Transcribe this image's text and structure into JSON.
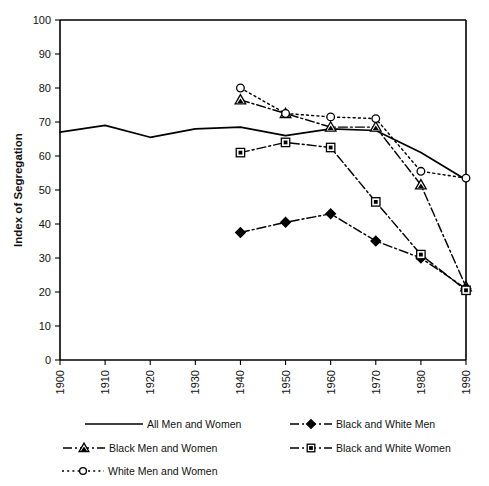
{
  "chart_data": {
    "type": "line",
    "title": "",
    "xlabel": "",
    "ylabel": "Index of Segregation",
    "categories": [
      1900,
      1910,
      1920,
      1930,
      1940,
      1950,
      1960,
      1970,
      1980,
      1990
    ],
    "x": [
      1900,
      1910,
      1920,
      1930,
      1940,
      1950,
      1960,
      1970,
      1980,
      1990
    ],
    "xlim": [
      1900,
      1990
    ],
    "ylim": [
      0,
      100
    ],
    "ytick_step": 10,
    "xtick_step": 10,
    "grid": false,
    "legend_position": "below-plot",
    "xtick_labels": [
      "1900",
      "1910",
      "1920",
      "1930",
      "1940",
      "1950",
      "1960",
      "1970",
      "1980",
      "1990"
    ],
    "ytick_labels": [
      "0",
      "10",
      "20",
      "30",
      "40",
      "50",
      "60",
      "70",
      "80",
      "90",
      "100"
    ],
    "series": [
      {
        "name": "All Men and  Women",
        "marker": "none",
        "dash": "solid",
        "x": [
          1900,
          1910,
          1920,
          1930,
          1940,
          1950,
          1960,
          1970,
          1980,
          1990
        ],
        "values": [
          67,
          69,
          65.5,
          68,
          68.5,
          66,
          68,
          67.5,
          61,
          53
        ]
      },
      {
        "name": "Black Men and Women",
        "marker": "triangle",
        "dash": "dashdot",
        "x": [
          1940,
          1950,
          1960,
          1970,
          1980,
          1990
        ],
        "values": [
          76.5,
          72.5,
          68.5,
          68.5,
          51.5,
          21.5
        ]
      },
      {
        "name": "White Men and Women",
        "marker": "circle",
        "dash": "dotted",
        "x": [
          1940,
          1950,
          1960,
          1970,
          1980,
          1990
        ],
        "values": [
          80,
          72.5,
          71.5,
          71,
          55.5,
          53.5
        ]
      },
      {
        "name": "Black and White Men",
        "marker": "diamond",
        "dash": "dashdot",
        "x": [
          1940,
          1950,
          1960,
          1970,
          1980,
          1990
        ],
        "values": [
          37.5,
          40.5,
          43,
          35,
          30,
          21
        ]
      },
      {
        "name": "Black and White Women",
        "marker": "square",
        "dash": "dashdot",
        "x": [
          1940,
          1950,
          1960,
          1970,
          1980,
          1990
        ],
        "values": [
          61,
          64,
          62.5,
          46.5,
          31,
          20.5
        ]
      }
    ]
  },
  "legend": {
    "entries": [
      {
        "label": "All Men and  Women",
        "marker": "none",
        "dash": "solid"
      },
      {
        "label": "Black and White Men",
        "marker": "diamond",
        "dash": "dashdot"
      },
      {
        "label": "Black Men and Women",
        "marker": "triangle",
        "dash": "dashdot"
      },
      {
        "label": "Black and White Women",
        "marker": "square",
        "dash": "dashdot"
      },
      {
        "label": "White Men and Women",
        "marker": "circle",
        "dash": "dotted"
      }
    ]
  },
  "colors": {
    "line": "#000000",
    "axis": "#000000",
    "background": "#ffffff",
    "text": "#111111"
  }
}
